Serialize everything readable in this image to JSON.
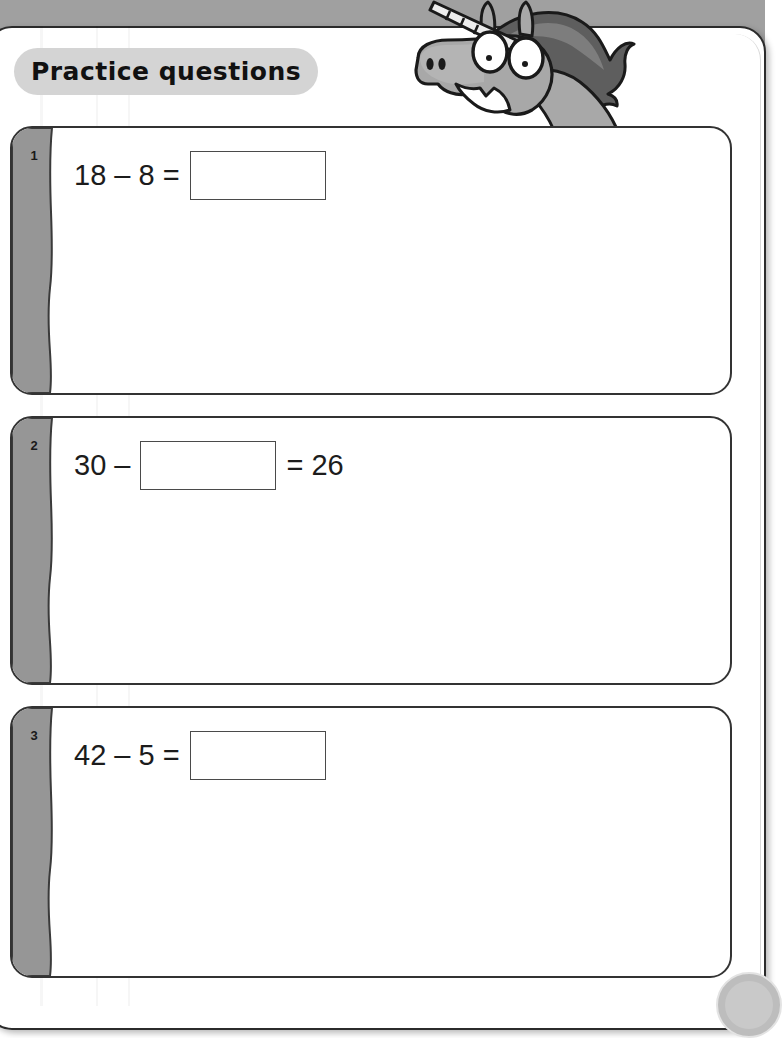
{
  "page": {
    "title": "Practice questions",
    "illustration": "unicorn-head",
    "background_color": "#a0a0a0",
    "sheet_color": "#ffffff",
    "strip_color": "#969696",
    "pill_color": "#d4d4d4"
  },
  "questions": [
    {
      "number": "1",
      "before_box": "18 – 8 =",
      "after_box": "",
      "answer_value": "",
      "box_position": "end"
    },
    {
      "number": "2",
      "before_box": "30 –",
      "after_box": "= 26",
      "answer_value": "",
      "box_position": "middle"
    },
    {
      "number": "3",
      "before_box": "42 – 5 =",
      "after_box": "",
      "answer_value": "",
      "box_position": "end"
    }
  ],
  "page_badge": {
    "label": ""
  }
}
